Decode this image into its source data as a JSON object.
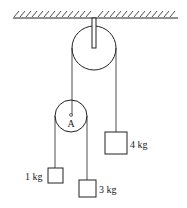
{
  "diagram": {
    "type": "pulley-system",
    "pulleys": [
      {
        "id": "fixed",
        "label": ""
      },
      {
        "id": "movable",
        "label": "A"
      }
    ],
    "masses": [
      {
        "id": "m1",
        "label": "1 kg"
      },
      {
        "id": "m3",
        "label": "3 kg"
      },
      {
        "id": "m4",
        "label": "4 kg"
      }
    ],
    "colors": {
      "line": "#222222",
      "background": "#ffffff"
    }
  }
}
